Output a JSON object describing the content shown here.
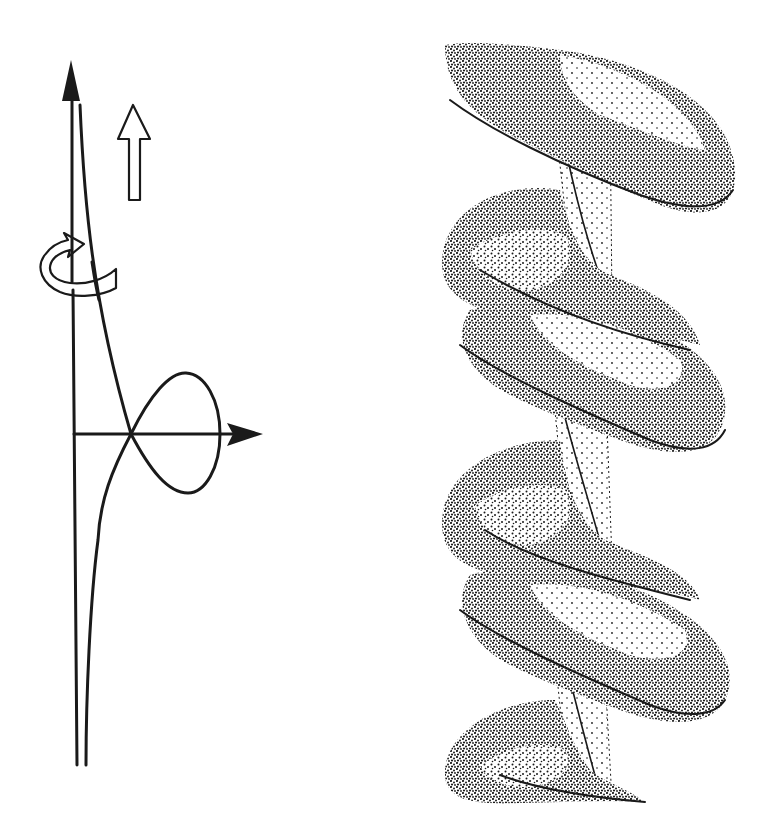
{
  "figure": {
    "colors": {
      "ink": "#1a1a1a",
      "background": "#ffffff"
    },
    "left_panel": {
      "name": "generating-curve-schematic",
      "elements": [
        {
          "name": "vertical-axis",
          "type": "arrow",
          "direction": "up",
          "style": "filled-head"
        },
        {
          "name": "horizontal-axis",
          "type": "arrow",
          "direction": "right",
          "style": "filled-head"
        },
        {
          "name": "translation-arrow",
          "type": "hollow-arrow",
          "direction": "up"
        },
        {
          "name": "rotation-arrow",
          "type": "curved-ribbon-arrow",
          "direction": "around-axis"
        },
        {
          "name": "profile-curve",
          "type": "loop-curve",
          "shape": "asymptotic tail with single loop crossing horizontal axis"
        }
      ]
    },
    "right_panel": {
      "name": "stippled-helix",
      "turns": 3,
      "rendering": "stipple",
      "elements": [
        {
          "name": "helical-tube",
          "type": "stippled-surface"
        },
        {
          "name": "twisted-core",
          "type": "stippled-surface"
        }
      ]
    }
  }
}
